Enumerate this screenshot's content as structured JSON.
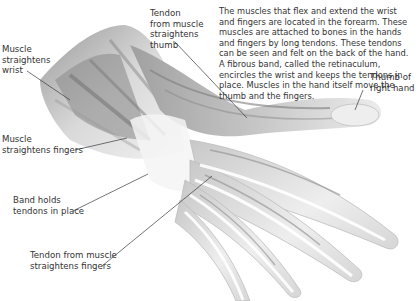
{
  "diagram": {
    "description": "The muscles that flex and extend the wrist and fingers are located in the forearm. These muscles are attached to bones in the hands and fingers by long tendons. These tendons can be seen and felt on the back of the hand. A fibrous band, called the retinaculum, encircles the wrist and keeps the tendons in place. Muscles in the hand itself move the thumb and the fingers.",
    "labels": [
      {
        "id": "tendon-thumb",
        "text": "Tendon\nfrom muscle\nstraightens\nthumb"
      },
      {
        "id": "muscle-wrist",
        "text": "Muscle\nstraightens\nwrist"
      },
      {
        "id": "thumb",
        "text": "Thumb of\nright hand"
      },
      {
        "id": "muscle-fingers",
        "text": "Muscle\nstraightens fingers"
      },
      {
        "id": "band",
        "text": "Band holds\ntendons in place"
      },
      {
        "id": "tendon-fingers",
        "text": "Tendon from muscle\nstraightens fingers"
      }
    ],
    "colors": {
      "background": "#ffffff",
      "muscle_dark": "#6f6f6f",
      "muscle_mid": "#a8a8a8",
      "muscle_light": "#dcdcdc",
      "leader_line": "#3a3a3a"
    }
  }
}
